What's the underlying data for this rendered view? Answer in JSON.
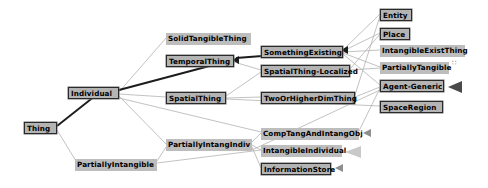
{
  "diagram": {
    "type": "ontology-hierarchy-graph",
    "background_color": "#ffffff",
    "node_fill_color": "#bdbdbd",
    "node_border_color": "#2a2a2a",
    "edge_color_light": "#b0b0b0",
    "edge_color_dark": "#1a1a1a",
    "arrow_color": "#8e8e8e"
  },
  "nodes": [
    {
      "id": "thing",
      "label": "Thing",
      "x": 24,
      "y": 122,
      "w": 33,
      "style": "boxed"
    },
    {
      "id": "individual",
      "label": "Individual",
      "x": 68,
      "y": 87,
      "w": 51,
      "style": "boxed"
    },
    {
      "id": "partially_intangible",
      "label": "PartiallyIntangible",
      "x": 75,
      "y": 159,
      "w": 82,
      "style": "plain"
    },
    {
      "id": "solid_tangible_thing",
      "label": "SolidTangibleThing",
      "x": 166,
      "y": 33,
      "w": 85,
      "style": "plain"
    },
    {
      "id": "temporal_thing",
      "label": "TemporalThing",
      "x": 166,
      "y": 55,
      "w": 68,
      "style": "boxed"
    },
    {
      "id": "spatial_thing",
      "label": "SpatialThing",
      "x": 166,
      "y": 92,
      "w": 60,
      "style": "boxed"
    },
    {
      "id": "partially_intang_indiv",
      "label": "PartiallyIntangIndiv",
      "x": 166,
      "y": 139,
      "w": 86,
      "style": "plain"
    },
    {
      "id": "something_existing",
      "label": "SomethingExisting",
      "x": 261,
      "y": 46,
      "w": 82,
      "style": "boxed"
    },
    {
      "id": "spatial_thing_localized",
      "label": "SpatialThing-Localized",
      "x": 261,
      "y": 65,
      "w": 89,
      "style": "boxed"
    },
    {
      "id": "two_or_higher_dim",
      "label": "TwoOrHigherDimThing",
      "x": 261,
      "y": 92,
      "w": 94,
      "style": "boxed"
    },
    {
      "id": "comp_tang_intang_obj",
      "label": "CompTangAndIntangObj",
      "x": 261,
      "y": 128,
      "w": 98,
      "style": "plain"
    },
    {
      "id": "intangible_individual",
      "label": "IntangibleIndividual",
      "x": 261,
      "y": 145,
      "w": 81,
      "style": "plain"
    },
    {
      "id": "information_store",
      "label": "InformationStore",
      "x": 261,
      "y": 163,
      "w": 70,
      "style": "boxed"
    },
    {
      "id": "entity",
      "label": "Entity",
      "x": 380,
      "y": 9,
      "w": 32,
      "style": "boxed"
    },
    {
      "id": "place",
      "label": "Place",
      "x": 380,
      "y": 28,
      "w": 30,
      "style": "boxed"
    },
    {
      "id": "intangible_exist_thing",
      "label": "IntangibleExistThing",
      "x": 380,
      "y": 45,
      "w": 85,
      "style": "plain"
    },
    {
      "id": "partially_tangible",
      "label": "PartiallyTangible",
      "x": 380,
      "y": 62,
      "w": 69,
      "style": "plain"
    },
    {
      "id": "agent_generic",
      "label": "Agent-Generic",
      "x": 380,
      "y": 80,
      "w": 64,
      "style": "boxed"
    },
    {
      "id": "space_region",
      "label": "SpaceRegion",
      "x": 380,
      "y": 101,
      "w": 63,
      "style": "boxed"
    }
  ],
  "edges": [
    {
      "from": "thing",
      "to": "individual",
      "weight": "heavy"
    },
    {
      "from": "thing",
      "to": "partially_intangible",
      "weight": "light"
    },
    {
      "from": "individual",
      "to": "solid_tangible_thing",
      "weight": "light"
    },
    {
      "from": "individual",
      "to": "temporal_thing",
      "weight": "heavy"
    },
    {
      "from": "individual",
      "to": "spatial_thing",
      "weight": "light"
    },
    {
      "from": "individual",
      "to": "partially_intang_indiv",
      "weight": "light"
    },
    {
      "from": "partially_intangible",
      "to": "partially_intang_indiv",
      "weight": "light"
    },
    {
      "from": "temporal_thing",
      "to": "something_existing",
      "weight": "heavy"
    },
    {
      "from": "temporal_thing",
      "to": "spatial_thing_localized",
      "weight": "light"
    },
    {
      "from": "spatial_thing",
      "to": "spatial_thing_localized",
      "weight": "light"
    },
    {
      "from": "spatial_thing",
      "to": "two_or_higher_dim",
      "weight": "light"
    },
    {
      "from": "spatial_thing",
      "to": "space_region",
      "weight": "light"
    },
    {
      "from": "partially_intang_indiv",
      "to": "comp_tang_intang_obj",
      "weight": "light"
    },
    {
      "from": "partially_intang_indiv",
      "to": "intangible_individual",
      "weight": "light"
    },
    {
      "from": "partially_intang_indiv",
      "to": "information_store",
      "weight": "light"
    },
    {
      "from": "something_existing",
      "to": "entity",
      "weight": "light"
    },
    {
      "from": "something_existing",
      "to": "place",
      "weight": "light"
    },
    {
      "from": "something_existing",
      "to": "intangible_exist_thing",
      "weight": "light"
    },
    {
      "from": "something_existing",
      "to": "partially_tangible",
      "weight": "light"
    },
    {
      "from": "something_existing",
      "to": "agent_generic",
      "weight": "light"
    },
    {
      "from": "spatial_thing_localized",
      "to": "place",
      "weight": "light"
    },
    {
      "from": "spatial_thing_localized",
      "to": "partially_tangible",
      "weight": "light"
    },
    {
      "from": "two_or_higher_dim",
      "to": "entity",
      "weight": "light"
    },
    {
      "from": "two_or_higher_dim",
      "to": "agent_generic",
      "weight": "light"
    },
    {
      "from": "comp_tang_intang_obj",
      "to": "agent_generic",
      "weight": "light"
    }
  ],
  "markers": {
    "arrow_nodes": [
      "comp_tang_intang_obj",
      "intangible_individual",
      "information_store",
      "agent_generic"
    ],
    "dots_nodes": [
      "partially_tangible"
    ]
  }
}
